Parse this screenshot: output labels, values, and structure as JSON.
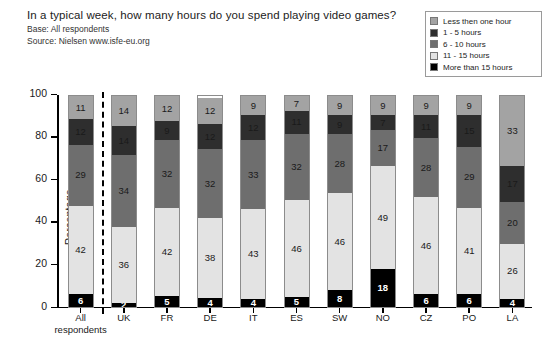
{
  "header": {
    "title": "In a typical week, how many hours do you spend playing video games?",
    "base": "Base: All respondents",
    "source": "Source: Nielsen  www.isfe-eu.org"
  },
  "legend": {
    "items": [
      {
        "label": "Less then one hour",
        "color": "#a3a3a3"
      },
      {
        "label": "1 - 5 hours",
        "color": "#2e2e2e"
      },
      {
        "label": "6 - 10 hours",
        "color": "#6e6e6e"
      },
      {
        "label": "11 - 15 hours",
        "color": "#e3e3e3"
      },
      {
        "label": "More than 15 hours",
        "color": "#000000"
      }
    ]
  },
  "chart_data": {
    "type": "bar",
    "subtype": "stacked-vertical-100",
    "title": "In a typical week, how many hours do you spend playing video games?",
    "xlabel": "",
    "ylabel": "Percentage",
    "ylim": [
      0,
      100
    ],
    "yticks": [
      0,
      20,
      40,
      60,
      80,
      100
    ],
    "grid": false,
    "legend_position": "top-right",
    "categories": [
      "All respondents",
      "UK",
      "FR",
      "DE",
      "IT",
      "ES",
      "SW",
      "NO",
      "CZ",
      "PO",
      "LA"
    ],
    "stack_order_bottom_to_top": [
      "More than 15 hours",
      "11 - 15 hours",
      "6 - 10 hours",
      "1 - 5 hours",
      "Less then one hour"
    ],
    "series": [
      {
        "name": "More than 15 hours",
        "color": "#000000",
        "text_color": "#ffffff",
        "values": [
          6,
          2,
          5,
          4,
          4,
          5,
          8,
          18,
          6,
          6,
          4
        ]
      },
      {
        "name": "11 - 15 hours",
        "color": "#e3e3e3",
        "text_color": "#1a1a1a",
        "values": [
          42,
          36,
          42,
          38,
          43,
          46,
          46,
          49,
          46,
          41,
          26
        ]
      },
      {
        "name": "6 - 10 hours",
        "color": "#6e6e6e",
        "text_color": "#1a1a1a",
        "values": [
          29,
          34,
          32,
          32,
          33,
          32,
          28,
          17,
          28,
          29,
          20
        ]
      },
      {
        "name": "1 - 5 hours",
        "color": "#2e2e2e",
        "text_color": "#1a1a1a",
        "values": [
          12,
          14,
          9,
          12,
          12,
          11,
          9,
          7,
          11,
          15,
          17
        ]
      },
      {
        "name": "Less then one hour",
        "color": "#a3a3a3",
        "text_color": "#1a1a1a",
        "values": [
          11,
          14,
          12,
          12,
          9,
          7,
          9,
          9,
          9,
          9,
          33
        ]
      }
    ],
    "bars": [
      {
        "category": "All respondents",
        "label_line1": "All",
        "label_line2": "respondents",
        "values": {
          "More than 15 hours": 6,
          "11 - 15 hours": 42,
          "6 - 10 hours": 29,
          "1 - 5 hours": 12,
          "Less then one hour": 11
        }
      },
      {
        "category": "UK",
        "label_line1": "UK",
        "label_line2": "",
        "values": {
          "More than 15 hours": 2,
          "11 - 15 hours": 36,
          "6 - 10 hours": 34,
          "1 - 5 hours": 14,
          "Less then one hour": 14
        }
      },
      {
        "category": "FR",
        "label_line1": "FR",
        "label_line2": "",
        "values": {
          "More than 15 hours": 5,
          "11 - 15 hours": 42,
          "6 - 10 hours": 32,
          "1 - 5 hours": 9,
          "Less then one hour": 12
        }
      },
      {
        "category": "DE",
        "label_line1": "DE",
        "label_line2": "",
        "values": {
          "More than 15 hours": 4,
          "11 - 15 hours": 38,
          "6 - 10 hours": 32,
          "1 - 5 hours": 12,
          "Less then one hour": 12
        }
      },
      {
        "category": "IT",
        "label_line1": "IT",
        "label_line2": "",
        "values": {
          "More than 15 hours": 4,
          "11 - 15 hours": 43,
          "6 - 10 hours": 33,
          "1 - 5 hours": 12,
          "Less then one hour": 9
        }
      },
      {
        "category": "ES",
        "label_line1": "ES",
        "label_line2": "",
        "values": {
          "More than 15 hours": 5,
          "11 - 15 hours": 46,
          "6 - 10 hours": 32,
          "1 - 5 hours": 11,
          "Less then one hour": 7
        }
      },
      {
        "category": "SW",
        "label_line1": "SW",
        "label_line2": "",
        "values": {
          "More than 15 hours": 8,
          "11 - 15 hours": 46,
          "6 - 10 hours": 28,
          "1 - 5 hours": 9,
          "Less then one hour": 9
        }
      },
      {
        "category": "NO",
        "label_line1": "NO",
        "label_line2": "",
        "values": {
          "More than 15 hours": 18,
          "11 - 15 hours": 49,
          "6 - 10 hours": 17,
          "1 - 5 hours": 7,
          "Less then one hour": 9
        }
      },
      {
        "category": "CZ",
        "label_line1": "CZ",
        "label_line2": "",
        "values": {
          "More than 15 hours": 6,
          "11 - 15 hours": 46,
          "6 - 10 hours": 28,
          "1 - 5 hours": 11,
          "Less then one hour": 9
        }
      },
      {
        "category": "PO",
        "label_line1": "PO",
        "label_line2": "",
        "values": {
          "More than 15 hours": 6,
          "11 - 15 hours": 41,
          "6 - 10 hours": 29,
          "1 - 5 hours": 15,
          "Less then one hour": 9
        }
      },
      {
        "category": "LA",
        "label_line1": "LA",
        "label_line2": "",
        "values": {
          "More than 15 hours": 4,
          "11 - 15 hours": 26,
          "6 - 10 hours": 20,
          "1 - 5 hours": 17,
          "Less then one hour": 33
        }
      }
    ],
    "annotations": [
      {
        "type": "vertical-dashed-divider",
        "after_category": "All respondents"
      }
    ]
  }
}
